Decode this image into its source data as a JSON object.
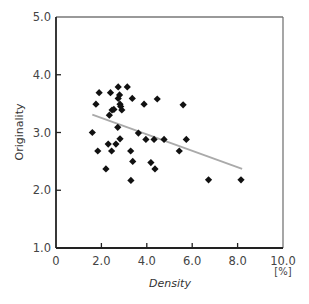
{
  "chart_data": {
    "type": "scatter",
    "title": "",
    "xlabel": "Density",
    "xunit": "[%]",
    "ylabel": "Originality",
    "xlim": [
      0,
      10
    ],
    "ylim": [
      1,
      5
    ],
    "xticks": [
      "0",
      "2.0",
      "4.0",
      "6.0",
      "8.0",
      "10.0"
    ],
    "yticks": [
      "1.0",
      "2.0",
      "3.0",
      "4.0",
      "5.0"
    ],
    "grid": false,
    "legend": null,
    "series": [
      {
        "name": "samples",
        "marker": "diamond",
        "points": [
          [
            1.6,
            3.0
          ],
          [
            1.76,
            3.49
          ],
          [
            1.9,
            3.69
          ],
          [
            1.84,
            2.68
          ],
          [
            2.2,
            2.37
          ],
          [
            2.3,
            2.8
          ],
          [
            2.35,
            3.3
          ],
          [
            2.4,
            3.69
          ],
          [
            2.45,
            2.68
          ],
          [
            2.47,
            3.39
          ],
          [
            2.55,
            3.4
          ],
          [
            2.64,
            2.8
          ],
          [
            2.72,
            3.09
          ],
          [
            2.74,
            3.59
          ],
          [
            2.74,
            3.79
          ],
          [
            2.8,
            3.65
          ],
          [
            2.82,
            3.49
          ],
          [
            2.82,
            2.89
          ],
          [
            2.85,
            3.45
          ],
          [
            2.9,
            3.39
          ],
          [
            3.14,
            3.79
          ],
          [
            3.29,
            2.68
          ],
          [
            3.3,
            2.17
          ],
          [
            3.36,
            3.59
          ],
          [
            3.38,
            2.5
          ],
          [
            3.63,
            2.99
          ],
          [
            3.88,
            3.49
          ],
          [
            3.96,
            2.88
          ],
          [
            4.18,
            2.48
          ],
          [
            4.32,
            2.88
          ],
          [
            4.36,
            2.37
          ],
          [
            4.46,
            3.58
          ],
          [
            4.76,
            2.88
          ],
          [
            5.43,
            2.68
          ],
          [
            5.6,
            3.48
          ],
          [
            5.74,
            2.88
          ],
          [
            6.72,
            2.18
          ],
          [
            8.15,
            2.18
          ]
        ],
        "color": "#111111"
      },
      {
        "name": "regression",
        "type": "line",
        "points": [
          [
            1.6,
            3.31
          ],
          [
            8.2,
            2.37
          ]
        ],
        "color": "#aaaaaa"
      }
    ]
  }
}
